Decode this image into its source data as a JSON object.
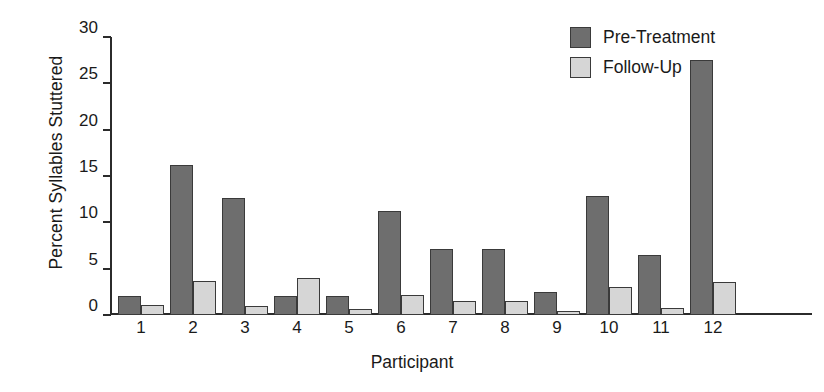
{
  "chart_data": {
    "type": "bar",
    "title": "",
    "xlabel": "Participant",
    "ylabel": "Percent Syllables Stuttered",
    "categories": [
      "1",
      "2",
      "3",
      "4",
      "5",
      "6",
      "7",
      "8",
      "9",
      "10",
      "11",
      "12"
    ],
    "series": [
      {
        "name": "Pre-Treatment",
        "color": "#6e6e6e",
        "values": [
          2.0,
          16.2,
          12.6,
          2.1,
          2.1,
          11.2,
          7.1,
          7.1,
          2.5,
          12.8,
          6.5,
          27.5
        ]
      },
      {
        "name": "Follow-Up",
        "color": "#d6d6d6",
        "values": [
          1.1,
          3.7,
          1.0,
          4.0,
          0.6,
          2.2,
          1.5,
          1.5,
          0.4,
          3.0,
          0.8,
          3.6
        ]
      }
    ],
    "ylim": [
      0,
      30
    ],
    "yticks": [
      0,
      5,
      10,
      15,
      20,
      25,
      30
    ],
    "ytick_labels": [
      "0",
      "5",
      "10",
      "15",
      "20",
      "25",
      "30"
    ],
    "grid": false,
    "legend_position": "top-right"
  },
  "legend": {
    "entries": [
      {
        "label": "Pre-Treatment",
        "swatch": "dark-gray-swatch"
      },
      {
        "label": "Follow-Up",
        "swatch": "light-gray-swatch"
      }
    ]
  }
}
